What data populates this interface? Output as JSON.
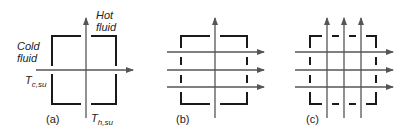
{
  "panels": [
    {
      "id": "a",
      "caption": "(a)"
    },
    {
      "id": "b",
      "caption": "(b)"
    },
    {
      "id": "c",
      "caption": "(c)"
    }
  ],
  "labels": {
    "hot_fluid_line1": "Hot",
    "hot_fluid_line2": "fluid",
    "cold_fluid_line1": "Cold",
    "cold_fluid_line2": "fluid",
    "t_cold_main": "T",
    "t_cold_sub": "c,su",
    "t_hot_main": "T",
    "t_hot_sub": "h,su"
  },
  "colors": {
    "box": "#1a1a1a",
    "arrow": "#555555",
    "text": "#222222"
  }
}
